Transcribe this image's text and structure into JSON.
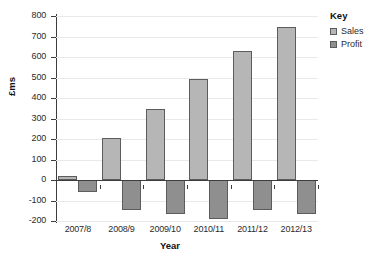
{
  "chart_data": {
    "type": "bar",
    "title": "",
    "xlabel": "Year",
    "ylabel": "£ms",
    "categories": [
      "2007/8",
      "2008/9",
      "2009/10",
      "2010/11",
      "2011/12",
      "2012/13"
    ],
    "series": [
      {
        "name": "Sales",
        "color": "#b6b6b6",
        "values": [
          20,
          205,
          348,
          495,
          630,
          745
        ]
      },
      {
        "name": "Profit",
        "color": "#8f8f8f",
        "values": [
          -60,
          -145,
          -165,
          -188,
          -148,
          -165
        ]
      }
    ],
    "ylim": [
      -200,
      800
    ],
    "ytick_step": 100,
    "yticks": [
      800,
      700,
      600,
      500,
      400,
      300,
      200,
      100,
      0,
      -100,
      -200
    ],
    "ytick_labels": [
      "800",
      "700",
      "600",
      "500",
      "400",
      "300",
      "200",
      "100",
      "0",
      "-100",
      "-200"
    ],
    "grid": true,
    "grid_axis": "y",
    "legend_position": "right",
    "legend_title": "Key",
    "bar_border_color": "#5c5c5c",
    "zero_line_color": "#3d3d3d"
  },
  "legend": {
    "title": "Key",
    "entries": [
      {
        "label": "Sales"
      },
      {
        "label": "Profit"
      }
    ]
  },
  "axes": {
    "x_title": "Year",
    "y_title": "£ms"
  }
}
